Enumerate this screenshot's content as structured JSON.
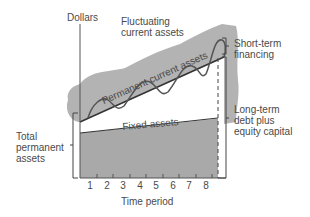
{
  "diagram": {
    "y_axis_label": "Dollars",
    "x_axis_label": "Time period",
    "x_ticks": [
      "1",
      "2",
      "3",
      "4",
      "5",
      "6",
      "7",
      "8"
    ],
    "regions": {
      "fluctuating": [
        "Fluctuating",
        "current assets"
      ],
      "permanent_current": "Permanent current assets",
      "fixed": "Fixed assets"
    },
    "left_bracket_label": [
      "Total",
      "permanent",
      "assets"
    ],
    "right_labels": {
      "short_term": [
        "Short-term",
        "financing"
      ],
      "long_term": [
        "Long-term",
        "debt plus",
        "equity capital"
      ]
    },
    "colors": {
      "fill_gray": "#a9a9a9",
      "cloud_gray": "#b3b3b3",
      "line": "#333333",
      "text": "#4a4a4a"
    }
  }
}
